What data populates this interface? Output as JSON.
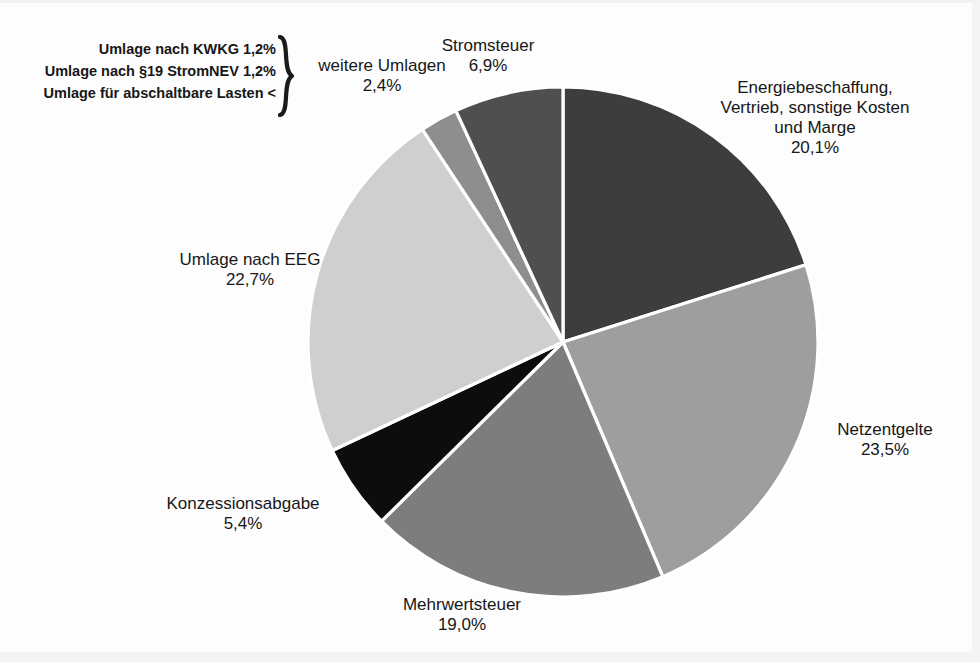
{
  "chart_data": {
    "type": "pie",
    "title": "",
    "start_angle_deg": 0,
    "direction": "clockwise",
    "center": {
      "x": 563,
      "y": 342
    },
    "radius": 255,
    "slice_gap_deg": 1.0,
    "categories": [
      "Energiebeschaffung, Vertrieb, sonstige Kosten und Marge",
      "Netzentgelte",
      "Mehrwertsteuer",
      "Konzessionsabgabe",
      "Umlage nach EEG",
      "weitere Umlagen",
      "Stromsteuer"
    ],
    "values": [
      20.1,
      23.5,
      19.0,
      5.4,
      22.7,
      2.4,
      6.9
    ],
    "value_labels": [
      "20,1%",
      "23,5%",
      "19,0%",
      "5,4%",
      "22,7%",
      "2,4%",
      "6,9%"
    ],
    "colors": [
      "#3d3d3d",
      "#9e9e9e",
      "#7d7d7d",
      "#0d0d0d",
      "#cfcfcf",
      "#8e8e8e",
      "#4f4f4f"
    ],
    "slice_border_color": "#ffffff",
    "legend": "labels-outside",
    "unit": "%"
  },
  "slices": [
    {
      "name": "energiebeschaffung",
      "label_line1": "Energiebeschaffung,",
      "label_line2": "Vertrieb, sonstige Kosten",
      "label_line3": "und Marge",
      "percent": "20,1%",
      "color": "#3d3d3d"
    },
    {
      "name": "netzentgelte",
      "label_line1": "Netzentgelte",
      "percent": "23,5%",
      "color": "#9e9e9e"
    },
    {
      "name": "mehrwertsteuer",
      "label_line1": "Mehrwertsteuer",
      "percent": "19,0%",
      "color": "#7d7d7d"
    },
    {
      "name": "konzessionsabgabe",
      "label_line1": "Konzessionsabgabe",
      "percent": "5,4%",
      "color": "#0d0d0d"
    },
    {
      "name": "umlage-eeg",
      "label_line1": "Umlage nach EEG",
      "percent": "22,7%",
      "color": "#cfcfcf"
    },
    {
      "name": "weitere-umlagen",
      "label_line1": "weitere Umlagen",
      "percent": "2,4%",
      "color": "#8e8e8e"
    },
    {
      "name": "stromsteuer",
      "label_line1": "Stromsteuer",
      "percent": "6,9%",
      "color": "#4f4f4f"
    }
  ],
  "umlagen_breakdown": {
    "items": [
      "Umlage nach KWKG 1,2%",
      "Umlage nach §19 StromNEV 1,2%",
      "Umlage für abschaltbare Lasten <"
    ],
    "brace_glyph": "}",
    "summary_label": "weitere Umlagen",
    "summary_percent": "2,4%"
  }
}
